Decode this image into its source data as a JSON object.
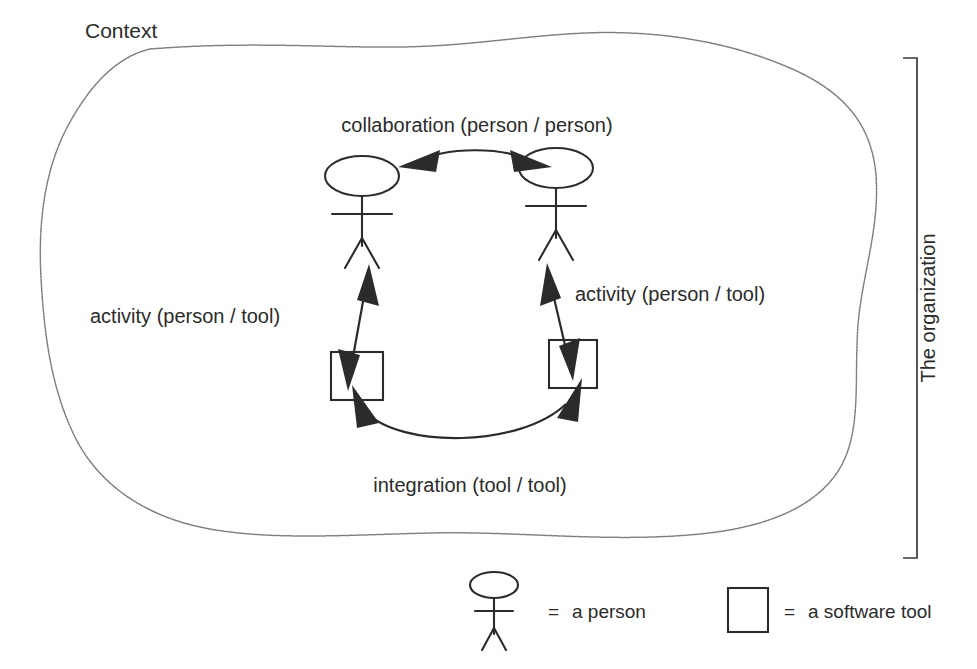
{
  "figure": {
    "context_label": "Context",
    "organization_label": "The organization",
    "edges": [
      {
        "id": "collaboration",
        "label": "collaboration (person / person)"
      },
      {
        "id": "activity-left",
        "label": "activity (person / tool)"
      },
      {
        "id": "activity-right",
        "label": "activity (person / tool)"
      },
      {
        "id": "integration",
        "label": "integration (tool / tool)"
      }
    ],
    "nodes": [
      {
        "id": "person-left",
        "kind": "person"
      },
      {
        "id": "person-right",
        "kind": "person"
      },
      {
        "id": "tool-left",
        "kind": "software-tool"
      },
      {
        "id": "tool-right",
        "kind": "software-tool"
      }
    ],
    "legend": [
      {
        "id": "legend-person",
        "symbol": "person-stick-figure",
        "equals": "=",
        "label": "a person"
      },
      {
        "id": "legend-tool",
        "symbol": "software-tool-box",
        "equals": "=",
        "label": "a software tool"
      }
    ],
    "colors": {
      "ink": "#2b2b2b",
      "blob_outline": "#7d7d7d",
      "bracket": "#3a3a3a",
      "background": "#ffffff"
    }
  }
}
